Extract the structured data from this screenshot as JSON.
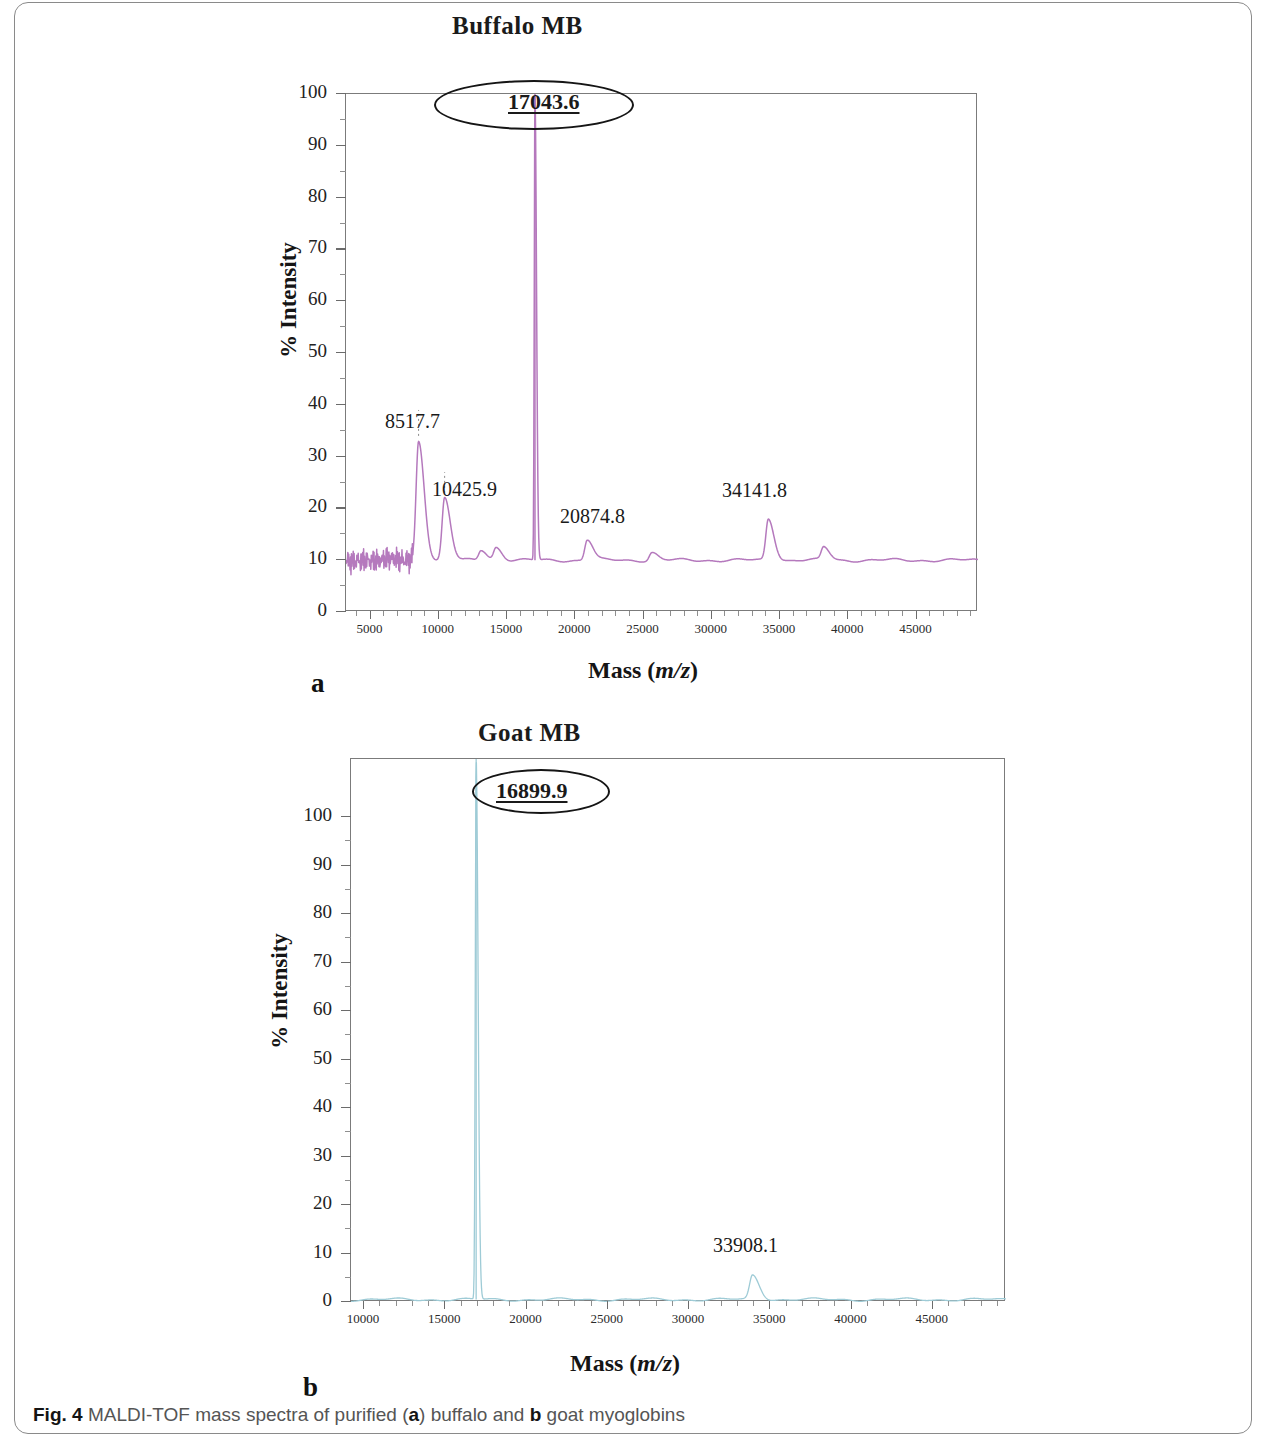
{
  "figure": {
    "caption_bold": "Fig. 4",
    "caption_text": "MALDI-TOF mass spectra of purified (",
    "caption_a": "a",
    "caption_mid": ") buffalo and ",
    "caption_b": "b",
    "caption_end": " goat myoglobins"
  },
  "panel_a": {
    "title": "Buffalo MB",
    "letter": "a",
    "xlabel_main": "Mass (",
    "xlabel_italic": "m/z",
    "xlabel_close": ")",
    "ylabel": "% Intensity",
    "trace_color": "#b579bd",
    "main_peak_label": "17043.6"
  },
  "panel_b": {
    "title": "Goat MB",
    "letter": "b",
    "xlabel_main": "Mass (",
    "xlabel_italic": "m/z",
    "xlabel_close": ")",
    "ylabel": "% Intensity",
    "trace_color": "#9ecbd6",
    "main_peak_label": "16899.9"
  },
  "chart_data": [
    {
      "type": "line",
      "title": "Buffalo MB",
      "panel": "a",
      "xlabel": "Mass (m/z)",
      "ylabel": "% Intensity",
      "xlim": [
        3200,
        49500
      ],
      "ylim": [
        0,
        100
      ],
      "xticks": [
        5000,
        10000,
        15000,
        20000,
        25000,
        30000,
        35000,
        40000,
        45000
      ],
      "xtick_labels": [
        "5000",
        "10000",
        "15000",
        "20000",
        "25000",
        "30000",
        "35000",
        "40000",
        "45000"
      ],
      "yticks": [
        0,
        10,
        20,
        30,
        40,
        50,
        60,
        70,
        80,
        90,
        100
      ],
      "ytick_labels": [
        "0",
        "10",
        "20",
        "30",
        "40",
        "50",
        "60",
        "70",
        "80",
        "90",
        "100"
      ],
      "grid": false,
      "legend": "none",
      "baseline": 10,
      "series": [
        {
          "name": "Buffalo myoglobin spectrum",
          "color": "#b579bd",
          "peaks": [
            {
              "mass": 8517.7,
              "intensity": 33,
              "labeled": true,
              "label": "8517.7"
            },
            {
              "mass": 10425.9,
              "intensity": 22,
              "labeled": true,
              "label": "10425.9"
            },
            {
              "mass": 17043.6,
              "intensity": 100,
              "labeled": true,
              "label": "17043.6",
              "circled": true
            },
            {
              "mass": 20874.8,
              "intensity": 14,
              "labeled": true,
              "label": "20874.8"
            },
            {
              "mass": 34141.8,
              "intensity": 18,
              "labeled": true,
              "label": "34141.8"
            },
            {
              "mass": 13100,
              "intensity": 12,
              "labeled": false,
              "label": ""
            },
            {
              "mass": 14200,
              "intensity": 12.5,
              "labeled": false,
              "label": ""
            },
            {
              "mass": 25600,
              "intensity": 11.5,
              "labeled": false,
              "label": ""
            },
            {
              "mass": 38200,
              "intensity": 12.5,
              "labeled": false,
              "label": ""
            }
          ]
        }
      ],
      "annotations": [
        {
          "text": "8517.7",
          "x": 8517.7,
          "y": 37
        },
        {
          "text": "10425.9",
          "x": 10425.9,
          "y": 24
        },
        {
          "text": "17043.6",
          "x": 17043.6,
          "y": 100,
          "emphasis": "circled-underlined-bold"
        },
        {
          "text": "20874.8",
          "x": 20874.8,
          "y": 20
        },
        {
          "text": "34141.8",
          "x": 34141.8,
          "y": 23
        }
      ]
    },
    {
      "type": "line",
      "title": "Goat MB",
      "panel": "b",
      "xlabel": "Mass (m/z)",
      "ylabel": "% Intensity",
      "xlim": [
        9200,
        49500
      ],
      "ylim": [
        0,
        112
      ],
      "xticks": [
        10000,
        15000,
        20000,
        25000,
        30000,
        35000,
        40000,
        45000
      ],
      "xtick_labels": [
        "10000",
        "15000",
        "20000",
        "25000",
        "30000",
        "35000",
        "40000",
        "45000"
      ],
      "yticks": [
        0,
        10,
        20,
        30,
        40,
        50,
        60,
        70,
        80,
        90,
        100
      ],
      "ytick_labels": [
        "0",
        "10",
        "20",
        "30",
        "40",
        "50",
        "60",
        "70",
        "80",
        "90",
        "100"
      ],
      "grid": false,
      "legend": "none",
      "baseline": 0.5,
      "series": [
        {
          "name": "Goat myoglobin spectrum",
          "color": "#9ecbd6",
          "peaks": [
            {
              "mass": 16899.9,
              "intensity": 112,
              "labeled": true,
              "label": "16899.9",
              "circled": true
            },
            {
              "mass": 33908.1,
              "intensity": 5.5,
              "labeled": true,
              "label": "33908.1"
            }
          ]
        }
      ],
      "annotations": [
        {
          "text": "16899.9",
          "x": 16899.9,
          "y": 110,
          "emphasis": "circled-underlined-bold"
        },
        {
          "text": "33908.1",
          "x": 33908.1,
          "y": 11
        }
      ]
    }
  ]
}
